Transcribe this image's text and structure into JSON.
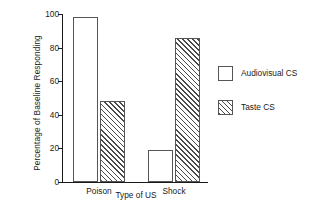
{
  "chart_data": {
    "type": "bar",
    "title": "",
    "xlabel": "Type of US",
    "ylabel": "Percentage of Baseline Responding",
    "categories": [
      "Poison",
      "Shock"
    ],
    "series": [
      {
        "name": "Audiovisual CS",
        "fill": "open",
        "values": [
          98,
          19
        ]
      },
      {
        "name": "Taste CS",
        "fill": "hatch",
        "values": [
          48,
          86
        ]
      }
    ],
    "ylim": [
      0,
      100
    ],
    "yticks": [
      0,
      20,
      40,
      60,
      80,
      100
    ],
    "ytick_labels": [
      "0",
      "20",
      "40",
      "60",
      "80",
      "100"
    ],
    "grid": false,
    "legend_position": "right",
    "colors": {
      "axis": "#1a1a1a",
      "text": "#1a1a1a",
      "bar_outline": "#555555",
      "bar_open_fill": "#ffffff",
      "hatch_line": "#4a4a4a",
      "background": "#ffffff"
    }
  }
}
